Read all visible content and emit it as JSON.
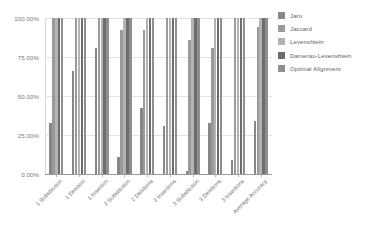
{
  "chart_data": {
    "type": "bar",
    "title": "",
    "subtitle": "",
    "xlabel": "",
    "ylabel": "",
    "ylim": [
      0,
      100
    ],
    "grid": true,
    "legend_position": "right",
    "y_ticks": [
      0,
      25,
      50,
      75,
      100
    ],
    "y_tick_labels": [
      "0.00%",
      "25.00%",
      "50.00%",
      "75.00%",
      "100.00%"
    ],
    "categories": [
      "1 Substitution",
      "1 Deletion",
      "1 Insertion",
      "2 Substitution",
      "2 Deletions",
      "2 Insertions",
      "3 Substitution",
      "3 Deletions",
      "3 Insertions",
      "Average Accuracy"
    ],
    "series": [
      {
        "name": "Jaro",
        "color": "#878787",
        "values": [
          33.0,
          66.0,
          81.0,
          11.0,
          42.0,
          31.0,
          2.0,
          33.0,
          9.0,
          34.0
        ]
      },
      {
        "name": "Jaccard",
        "color": "#9a9a9a",
        "values": [
          100.0,
          100.0,
          100.0,
          92.0,
          92.0,
          100.0,
          86.0,
          81.0,
          100.0,
          94.0
        ]
      },
      {
        "name": "Levenshtein",
        "color": "#b3b3b3",
        "values": [
          100.0,
          100.0,
          100.0,
          100.0,
          100.0,
          100.0,
          100.0,
          100.0,
          100.0,
          100.0
        ]
      },
      {
        "name": "Damerau-Levenshtein",
        "color": "#6d6d6d",
        "values": [
          100.0,
          100.0,
          100.0,
          100.0,
          100.0,
          100.0,
          100.0,
          100.0,
          100.0,
          100.0
        ]
      },
      {
        "name": "Optimal Alignment",
        "color": "#8f8f8f",
        "values": [
          100.0,
          100.0,
          100.0,
          100.0,
          100.0,
          100.0,
          100.0,
          100.0,
          100.0,
          100.0
        ]
      }
    ]
  }
}
